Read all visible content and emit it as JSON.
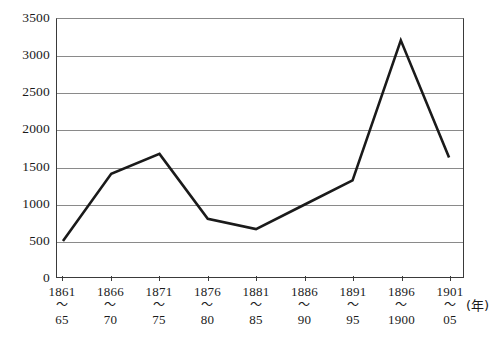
{
  "chart_data": {
    "type": "line",
    "title": "",
    "xlabel": "(年)",
    "ylabel": "",
    "ylim": [
      0,
      3500
    ],
    "ytick_step": 500,
    "yticks": [
      3500,
      3000,
      2500,
      2000,
      1500,
      1000,
      500,
      0
    ],
    "grid": true,
    "legend": "none",
    "categories": [
      "1861〜65",
      "1866〜70",
      "1871〜75",
      "1876〜80",
      "1881〜85",
      "1886〜90",
      "1891〜95",
      "1896〜1900",
      "1901〜05"
    ],
    "tick_labels": [
      {
        "start": "1861",
        "wave": "〜",
        "end": "65"
      },
      {
        "start": "1866",
        "wave": "〜",
        "end": "70"
      },
      {
        "start": "1871",
        "wave": "〜",
        "end": "75"
      },
      {
        "start": "1876",
        "wave": "〜",
        "end": "80"
      },
      {
        "start": "1881",
        "wave": "〜",
        "end": "85"
      },
      {
        "start": "1886",
        "wave": "〜",
        "end": "90"
      },
      {
        "start": "1891",
        "wave": "〜",
        "end": "95"
      },
      {
        "start": "1896",
        "wave": "〜",
        "end": "1900"
      },
      {
        "start": "1901",
        "wave": "〜",
        "end": "05"
      }
    ],
    "values": [
      490,
      1400,
      1670,
      790,
      650,
      980,
      1310,
      3210,
      1620
    ],
    "series": [
      {
        "name": "series-1",
        "values": [
          490,
          1400,
          1670,
          790,
          650,
          980,
          1310,
          3210,
          1620
        ],
        "color": "#1a1a1a",
        "line_width": 2.6
      }
    ],
    "colors": {
      "line": "#1a1a1a",
      "grid": "#8a8a8a",
      "axis": "#3a3a3a",
      "background": "#ffffff",
      "text": "#1a1a1a"
    }
  }
}
